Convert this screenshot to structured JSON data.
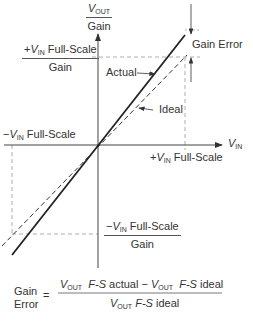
{
  "diagram": {
    "type": "gain-error-transfer-function",
    "axes": {
      "y_axis_label": {
        "var": "V",
        "sub": "OUT",
        "den": "Gain"
      },
      "x_axis_label": {
        "var": "V",
        "sub": "IN"
      }
    },
    "labels": {
      "pos_fs_gain": {
        "prefix": "+",
        "var": "V",
        "sub": "IN",
        "text": " Full-Scale",
        "den": "Gain"
      },
      "neg_fs": {
        "prefix": "−",
        "var": "V",
        "sub": "IN",
        "text": " Full-Scale"
      },
      "pos_fs": {
        "prefix": "+",
        "var": "V",
        "sub": "IN",
        "text": " Full-Scale"
      },
      "neg_fs_gain": {
        "prefix": "−",
        "var": "V",
        "sub": "IN",
        "text": " Full-Scale",
        "den": "Gain"
      },
      "gain_error": "Gain Error",
      "actual": "Actual",
      "ideal": "Ideal"
    },
    "formula": {
      "lhs_line1": "Gain",
      "lhs_line2": "Error",
      "equals": "=",
      "num_var1": "V",
      "num_sub1": "OUT",
      "num_fs1": "F-S",
      "num_text1": "actual − ",
      "num_var2": "V",
      "num_sub2": "OUT",
      "num_fs2": "F-S",
      "num_text2": "ideal",
      "den_var": "V",
      "den_sub": "OUT",
      "den_fs": "F-S",
      "den_text": "ideal"
    },
    "colors": {
      "line": "#222222",
      "dashed": "#888888",
      "axis": "#444444"
    }
  }
}
